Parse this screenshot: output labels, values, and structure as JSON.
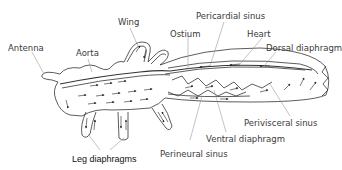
{
  "diagram": {
    "labels": {
      "antenna": "Antenna",
      "aorta": "Aorta",
      "wing": "Wing",
      "ostium": "Ostium",
      "pericardial_sinus": "Pericardial sinus",
      "heart": "Heart",
      "dorsal_diaphragm": "Dorsal diaphragm",
      "perivisceral_sinus": "Perivisceral sinus",
      "ventral_diaphragm": "Ventral diaphragm",
      "perineural_sinus": "Perineural sinus",
      "leg_diaphragms": "Leg diaphragms"
    },
    "colors": {
      "line": "#333333",
      "text": "#3a3a3a",
      "leader": "#9a9a9a"
    }
  }
}
